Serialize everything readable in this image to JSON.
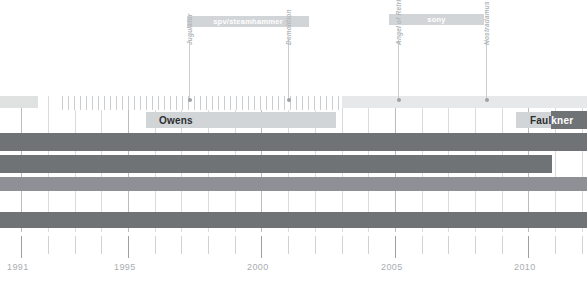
{
  "figure": {
    "type": "timeline-gantt",
    "title": "",
    "x_axis": {
      "label": "",
      "tick_labels": [
        "1991",
        "1995",
        "2000",
        "2005",
        "2010"
      ],
      "tick_values": [
        1991,
        1995,
        2000,
        2005,
        2010
      ],
      "minor_tick_interval_years": 1,
      "range": [
        1990.2,
        2012.2
      ]
    }
  },
  "chart_data": {
    "type": "bar",
    "title": "",
    "xlabel": "",
    "ylabel": "",
    "xlim": [
      1990.2,
      2012.2
    ],
    "grid": true,
    "legend_position": "none",
    "categories": [
      "label-era",
      "vocalist",
      "member-row-1",
      "member-row-2",
      "member-row-3",
      "member-row-4",
      "member-row-5"
    ],
    "record_labels": [
      {
        "name": "spv/steamhammer",
        "start": 1997.1,
        "end": 2002.7,
        "color": "#d2d5d7"
      },
      {
        "name": "sony",
        "start": 2005.0,
        "end": 2009.1,
        "color": "#d2d5d7"
      }
    ],
    "albums": [
      {
        "name": "Jugulator",
        "year": 1997.3
      },
      {
        "name": "Demolition",
        "year": 2001.0
      },
      {
        "name": "Angel of Retribution",
        "year": 2005.1
      },
      {
        "name": "Nostradamus",
        "year": 2008.4
      }
    ],
    "vocalists": [
      {
        "name": "Owens",
        "start": 1996.3,
        "end": 2002.7,
        "color": "#d2d5d7"
      },
      {
        "name": "Faulkner",
        "start": 2011.1,
        "end": 2012.2,
        "color": "#d2d5d7"
      }
    ],
    "series": [
      {
        "name": "top-light-band",
        "start": 1990.2,
        "end": 1991.9,
        "color": "#dfe2e0",
        "row": 0
      },
      {
        "name": "hatched-period",
        "start": 1992.5,
        "end": 2002.8,
        "color": "#cbced0",
        "row": 0
      },
      {
        "name": "late-light-band",
        "start": 2002.8,
        "end": 2012.2,
        "color": "#e6e8e9",
        "row": 0
      },
      {
        "name": "member-bar-1",
        "start": 1990.2,
        "end": 2012.2,
        "color": "#6f7376",
        "row": 2
      },
      {
        "name": "member-bar-2",
        "start": 1990.2,
        "end": 2011.1,
        "color": "#6f7376",
        "row": 3
      },
      {
        "name": "member-bar-3",
        "start": 1990.2,
        "end": 2012.2,
        "color": "#8d9195",
        "row": 4
      },
      {
        "name": "member-bar-5",
        "start": 1990.2,
        "end": 2012.2,
        "color": "#6f7376",
        "row": 6
      }
    ]
  },
  "colors": {
    "background": "#ffffff",
    "bar_dark": "#6f7376",
    "bar_mid": "#8d9195",
    "chip": "#d2d5d7",
    "band_light": "#e6e8e9",
    "band_green": "#dfe2e0",
    "gridline": "#d9dcdd",
    "gridline_major": "#b9bdbf",
    "axis_text": "#a9aeb1",
    "label_text_dark": "#2b2e30",
    "label_text_light": "#ffffff"
  }
}
